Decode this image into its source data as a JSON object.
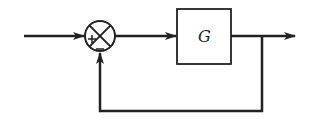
{
  "diagram": {
    "type": "feedback-control-loop",
    "block": {
      "label": "G"
    },
    "summing_junction": {
      "input_sign": "+",
      "feedback_sign": "−"
    },
    "colors": {
      "stroke": "#222222",
      "background": "#ffffff"
    }
  }
}
